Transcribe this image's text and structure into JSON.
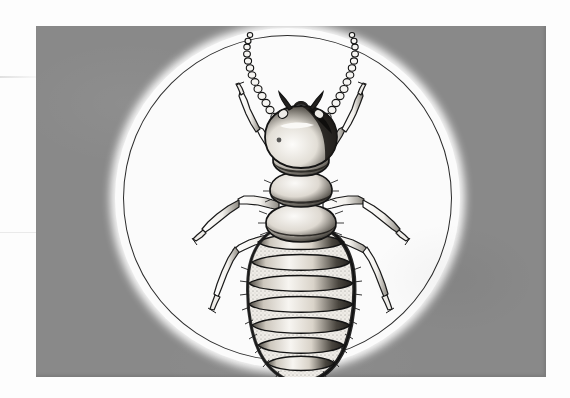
{
  "document": {
    "kind": "scanned-figure",
    "page_background": "#fdfdfd",
    "caption": ""
  },
  "plate": {
    "name": "gray-plate",
    "background_color": "#898989",
    "x": 36,
    "y": 26,
    "width": 510,
    "height": 351
  },
  "vignette": {
    "name": "white-oval-vignette",
    "fill_color": "#fbfbfb",
    "rule_color": "#2b2b2b",
    "shape": "ellipse",
    "x": 115,
    "y": 28,
    "width": 345,
    "height": 340
  },
  "illustration": {
    "subject": "termite",
    "view": "dorsal",
    "technique": "pen-and-ink stipple engraving",
    "ink_color": "#1a1a1a",
    "body_fill": "#f2f0ec",
    "parts": [
      {
        "name": "antenna-left",
        "type": "moniliform-antenna",
        "bead_count": 17
      },
      {
        "name": "antenna-right",
        "type": "moniliform-antenna",
        "bead_count": 17
      },
      {
        "name": "head-capsule",
        "type": "head"
      },
      {
        "name": "mandible-left",
        "type": "mandible"
      },
      {
        "name": "mandible-right",
        "type": "mandible"
      },
      {
        "name": "pronotum",
        "type": "thorax-segment"
      },
      {
        "name": "mesothorax",
        "type": "thorax-segment"
      },
      {
        "name": "metathorax",
        "type": "thorax-segment"
      },
      {
        "name": "abdomen",
        "type": "abdomen",
        "tergite_count": 8
      },
      {
        "name": "foreleg-left",
        "type": "leg"
      },
      {
        "name": "foreleg-right",
        "type": "leg"
      },
      {
        "name": "midleg-left",
        "type": "leg"
      },
      {
        "name": "midleg-right",
        "type": "leg"
      },
      {
        "name": "hindleg-left",
        "type": "leg"
      },
      {
        "name": "hindleg-right",
        "type": "leg"
      }
    ]
  },
  "scan_artifacts": {
    "seam_visible": true,
    "seam_positions": [
      76,
      232
    ]
  }
}
